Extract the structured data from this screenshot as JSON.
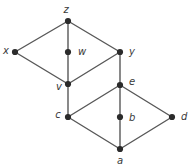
{
  "diagram": {
    "kind": "hasse-diagram",
    "title": "",
    "style": {
      "node_color": "#2b2b2b",
      "edge_color": "#585858",
      "label_color": "#3a3a3a",
      "background": "#ffffff",
      "node_radius": 3.1,
      "edge_width": 1.4
    },
    "nodes": [
      {
        "id": "z",
        "label": "z",
        "x": 68,
        "y": 21,
        "label_x": 66,
        "label_y": 10,
        "label_anchor": "middle"
      },
      {
        "id": "x",
        "label": "x",
        "x": 15,
        "y": 52,
        "label_x": 6,
        "label_y": 51,
        "label_anchor": "middle"
      },
      {
        "id": "w",
        "label": "w",
        "x": 68,
        "y": 52,
        "label_x": 78,
        "label_y": 52,
        "label_anchor": "start"
      },
      {
        "id": "y",
        "label": "y",
        "x": 120,
        "y": 52,
        "label_x": 129,
        "label_y": 52,
        "label_anchor": "start"
      },
      {
        "id": "v",
        "label": "v",
        "x": 68,
        "y": 84,
        "label_x": 59,
        "label_y": 87,
        "label_anchor": "middle"
      },
      {
        "id": "e",
        "label": "e",
        "x": 120,
        "y": 85,
        "label_x": 129,
        "label_y": 82,
        "label_anchor": "start"
      },
      {
        "id": "c",
        "label": "c",
        "x": 68,
        "y": 117,
        "label_x": 58,
        "label_y": 115,
        "label_anchor": "middle"
      },
      {
        "id": "b",
        "label": "b",
        "x": 120,
        "y": 117,
        "label_x": 129,
        "label_y": 118,
        "label_anchor": "start"
      },
      {
        "id": "d",
        "label": "d",
        "x": 172,
        "y": 117,
        "label_x": 181,
        "label_y": 117,
        "label_anchor": "start"
      },
      {
        "id": "a",
        "label": "a",
        "x": 120,
        "y": 149,
        "label_x": 120,
        "label_y": 161,
        "label_anchor": "middle"
      }
    ],
    "edges": [
      {
        "from": "z",
        "to": "x"
      },
      {
        "from": "z",
        "to": "w"
      },
      {
        "from": "z",
        "to": "y"
      },
      {
        "from": "x",
        "to": "v"
      },
      {
        "from": "w",
        "to": "v"
      },
      {
        "from": "y",
        "to": "v"
      },
      {
        "from": "v",
        "to": "c"
      },
      {
        "from": "y",
        "to": "e"
      },
      {
        "from": "e",
        "to": "c"
      },
      {
        "from": "e",
        "to": "b"
      },
      {
        "from": "e",
        "to": "d"
      },
      {
        "from": "c",
        "to": "a"
      },
      {
        "from": "b",
        "to": "a"
      },
      {
        "from": "d",
        "to": "a"
      }
    ]
  }
}
